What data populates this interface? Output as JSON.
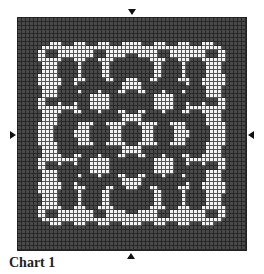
{
  "chart": {
    "caption": "Chart 1",
    "cols": 57,
    "rows": 58,
    "colors": {
      "dark": "#4a4a4a",
      "light": "#f4f4f4",
      "grid_line": "#222222"
    },
    "markers": [
      "top-center",
      "bottom-center",
      "left-middle",
      "right-middle"
    ]
  },
  "chart_data": {
    "type": "heatmap",
    "title": "Chart 1",
    "grid_size": [
      57,
      58
    ],
    "legend": [
      {
        "name": "dark stitch",
        "color": "#4a4a4a"
      },
      {
        "name": "light stitch",
        "color": "#f4f4f4"
      }
    ]
  }
}
